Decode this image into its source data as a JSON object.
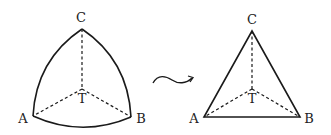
{
  "left_figure": {
    "description": "curved (Reuleaux-like) triangle",
    "labels": {
      "top": "C",
      "left": "A",
      "right": "B",
      "center": "T"
    }
  },
  "right_figure": {
    "description": "straight-edged triangle",
    "labels": {
      "top": "C",
      "left": "A",
      "right": "B",
      "center": "T"
    }
  },
  "transform_arrow": {
    "icon": "squiggle-arrow-icon",
    "meaning": "deforms to"
  },
  "colors": {
    "stroke": "#1a1a1a",
    "background": "#ffffff"
  }
}
